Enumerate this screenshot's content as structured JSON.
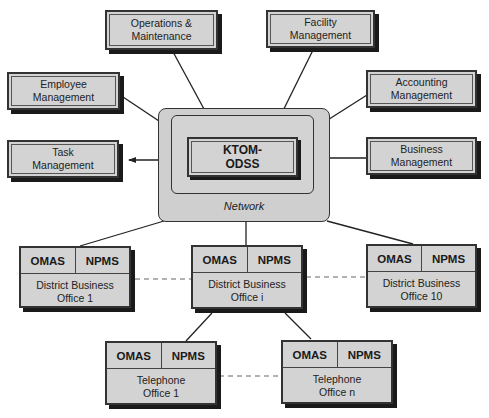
{
  "diagram": {
    "modules": {
      "operations": "Operations &\nMaintenance",
      "facility": "Facility\nManagement",
      "employee": "Employee\nManagement",
      "accounting": "Accounting\nManagement",
      "task": "Task\nManagement",
      "business": "Business\nManagement"
    },
    "core": "KTOM-\nODSS",
    "network_label": "Network",
    "offices": {
      "dbo1": {
        "left": "OMAS",
        "right": "NPMS",
        "name": "District Business\nOffice 1"
      },
      "dboi": {
        "left": "OMAS",
        "right": "NPMS",
        "name": "District Business\nOffice i"
      },
      "dbo10": {
        "left": "OMAS",
        "right": "NPMS",
        "name": "District Business\nOffice 10"
      },
      "to1": {
        "left": "OMAS",
        "right": "NPMS",
        "name": "Telephone\nOffice 1"
      },
      "ton": {
        "left": "OMAS",
        "right": "NPMS",
        "name": "Telephone\nOffice n"
      }
    }
  }
}
